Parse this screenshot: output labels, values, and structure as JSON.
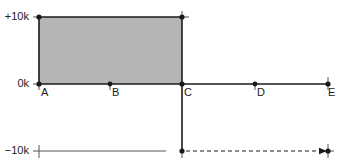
{
  "diagram": {
    "type": "step-position-diagram",
    "colors": {
      "fill": "#b5b5b5",
      "line": "#1a1a1a",
      "thin_line": "#555555"
    },
    "y_axis": {
      "labels": [
        {
          "text": "+10k",
          "value": 10000
        },
        {
          "text": "0k",
          "value": 0
        },
        {
          "text": "−10k",
          "value": -10000
        }
      ]
    },
    "points": [
      {
        "label": "A"
      },
      {
        "label": "B"
      },
      {
        "label": "C"
      },
      {
        "label": "D"
      },
      {
        "label": "E"
      }
    ],
    "shaded_region": {
      "from": "A",
      "to": "C",
      "y_from": 0,
      "y_to": 10000
    },
    "segments": [
      {
        "from": "A",
        "to": "E",
        "level": 0,
        "style": "solid"
      },
      {
        "from": "C",
        "level_from": 10000,
        "level_to": -10000,
        "style": "solid-vertical"
      },
      {
        "from": "A",
        "to": "C",
        "level": -10000,
        "style": "thin-solid"
      },
      {
        "from": "C",
        "to": "E",
        "level": -10000,
        "style": "dashed-arrow"
      }
    ]
  }
}
